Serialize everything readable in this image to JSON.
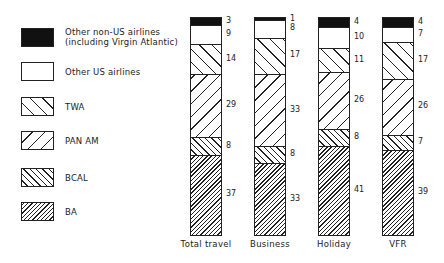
{
  "chart_data": {
    "type": "bar",
    "stacked": true,
    "title": "",
    "xlabel": "",
    "ylabel": "",
    "ylim": [
      0,
      100
    ],
    "grid": false,
    "legend_position": "left",
    "categories": [
      "Total travel",
      "Business",
      "Holiday",
      "VFR"
    ],
    "series": [
      {
        "name": "BA",
        "pattern": "dense-hatch",
        "values": [
          37,
          33,
          41,
          39
        ]
      },
      {
        "name": "BCAL",
        "pattern": "back-hatch",
        "values": [
          8,
          8,
          8,
          7
        ]
      },
      {
        "name": "PAN AM",
        "pattern": "wide-forward-hatch",
        "values": [
          29,
          33,
          26,
          26
        ]
      },
      {
        "name": "TWA",
        "pattern": "wide-back-hatch",
        "values": [
          14,
          17,
          11,
          17
        ]
      },
      {
        "name": "Other US airlines",
        "pattern": "white",
        "values": [
          9,
          8,
          10,
          7
        ]
      },
      {
        "name": "Other non-US airlines (including Virgin Atlantic)",
        "pattern": "black",
        "values": [
          3,
          1,
          4,
          4
        ]
      }
    ]
  },
  "legend": [
    {
      "line1": "Other non-US airlines",
      "line2": "(including Virgin Atlantic)",
      "pattern": "black"
    },
    {
      "line1": "Other US airlines",
      "line2": "",
      "pattern": "white"
    },
    {
      "line1": "TWA",
      "line2": "",
      "pattern": "twa"
    },
    {
      "line1": "PAN AM",
      "line2": "",
      "pattern": "panam"
    },
    {
      "line1": "BCAL",
      "line2": "",
      "pattern": "bcal"
    },
    {
      "line1": "BA",
      "line2": "",
      "pattern": "ba"
    }
  ]
}
